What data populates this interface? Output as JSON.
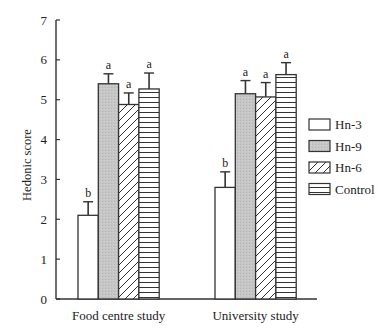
{
  "chart_data": {
    "type": "bar",
    "title": "",
    "xlabel": "",
    "ylabel": "Hedonic score",
    "ylim": [
      0,
      7
    ],
    "yticks": [
      0,
      1,
      2,
      3,
      4,
      5,
      6,
      7
    ],
    "grid": false,
    "legend_position": "right",
    "categories": [
      "Food centre study",
      "University study"
    ],
    "series": [
      {
        "name": "Hn-3",
        "fill": "white",
        "values": [
          2.1,
          2.8
        ],
        "error_upper": [
          2.44,
          3.19
        ],
        "significance": [
          "b",
          "b"
        ]
      },
      {
        "name": "Hn-9",
        "fill": "gray",
        "values": [
          5.4,
          5.15
        ],
        "error_upper": [
          5.65,
          5.48
        ],
        "significance": [
          "a",
          "a"
        ]
      },
      {
        "name": "Hn-6",
        "fill": "diagonal",
        "values": [
          4.88,
          5.07
        ],
        "error_upper": [
          5.17,
          5.43
        ],
        "significance": [
          "a",
          "a"
        ]
      },
      {
        "name": "Control",
        "fill": "horizontal",
        "values": [
          5.27,
          5.63
        ],
        "error_upper": [
          5.67,
          5.93
        ],
        "significance": [
          "a",
          "a"
        ]
      }
    ],
    "colors": {
      "stroke": "#333333",
      "gray_fill": "#c4c4c4",
      "white_fill": "#ffffff"
    }
  }
}
